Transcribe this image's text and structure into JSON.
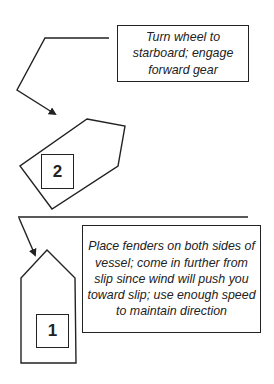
{
  "steps": [
    {
      "number": "2",
      "instruction": "Turn wheel to starboard; engage forward gear"
    },
    {
      "number": "1",
      "instruction": "Place fenders on both sides of vessel; come in further from slip since wind will push you toward slip; use enough speed to maintain direction"
    }
  ],
  "colors": {
    "line": "#222222",
    "background": "#ffffff"
  }
}
